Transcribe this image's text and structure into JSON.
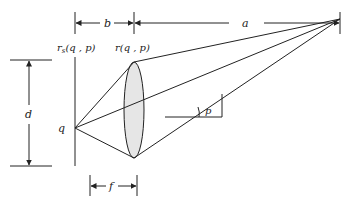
{
  "diagram": {
    "labels": {
      "b": "b",
      "a": "a",
      "rs_base": "r",
      "rs_sub": "s",
      "rs_args": "(q , p)",
      "r_full": "r(q , p)",
      "d": "d",
      "q": "q",
      "p": "p",
      "f": "f"
    },
    "colors": {
      "line": "#222222",
      "lens_fill": "#e6e6e6",
      "background": "#ffffff"
    }
  }
}
